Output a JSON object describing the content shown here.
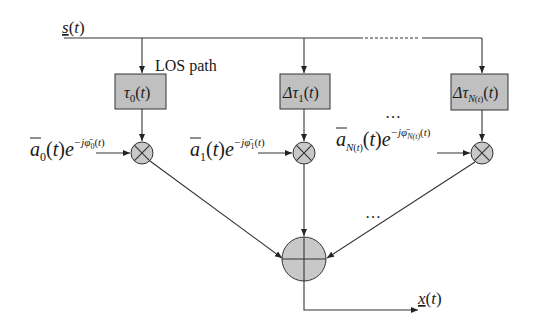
{
  "diagram": {
    "type": "block-diagram",
    "input_label": "s(t)",
    "output_label": "x(t)",
    "los_label": "LOS path",
    "ellipsis": "…",
    "branches": [
      {
        "delay_label": "τ0(t)",
        "gain_base": "ā",
        "gain_sub": "0",
        "gain_exp": "−jφ̄0(t)"
      },
      {
        "delay_label": "Δτ1(t)",
        "gain_base": "ā",
        "gain_sub": "1",
        "gain_exp": "−jφ̄1(t)"
      },
      {
        "delay_label": "ΔτN(t)(t)",
        "gain_base": "ā",
        "gain_sub": "N(t)",
        "gain_exp": "−jφ̄N(t)(t)"
      }
    ],
    "colors": {
      "box_fill": "#c0c0c0",
      "node_fill": "#c8c8c8",
      "stroke": "#333333"
    }
  }
}
